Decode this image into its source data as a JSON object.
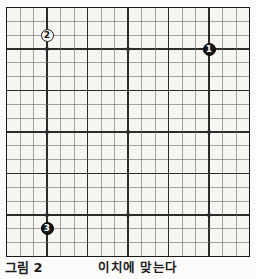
{
  "figure": {
    "caption_label": "그림 2",
    "caption_title": "이치에 맞는다",
    "board_size": 19,
    "board_colors": {
      "paper": "#f7f6f3",
      "line": "#6b6b6b",
      "heavy_line": "#2b2b2b",
      "border": "#1a1a1a",
      "black_stone": "#141414",
      "white_stone": "#fbfbf9",
      "page": "#fdfdfc"
    }
  },
  "board": {
    "star_points": [
      {
        "col": 3,
        "row": 3
      },
      {
        "col": 9,
        "row": 3
      },
      {
        "col": 15,
        "row": 3
      },
      {
        "col": 3,
        "row": 9
      },
      {
        "col": 9,
        "row": 9
      },
      {
        "col": 15,
        "row": 9
      },
      {
        "col": 3,
        "row": 15
      },
      {
        "col": 9,
        "row": 15
      },
      {
        "col": 15,
        "row": 15
      }
    ],
    "stones": [
      {
        "move": "1",
        "color": "black",
        "col": 15,
        "row": 3,
        "label": "1"
      },
      {
        "move": "2",
        "color": "white",
        "col": 3,
        "row": 2,
        "label": "2"
      },
      {
        "move": "3",
        "color": "black",
        "col": 3,
        "row": 16,
        "label": "3"
      }
    ]
  },
  "chart_data": {
    "type": "diagram",
    "title": "그림 2",
    "subtitle": "이치에 맞는다",
    "grid": "19x19",
    "moves": [
      {
        "number": 1,
        "color": "black",
        "coordinate": "Q16",
        "col": 15,
        "row": 3
      },
      {
        "number": 2,
        "color": "white",
        "coordinate": "D17",
        "col": 3,
        "row": 2
      },
      {
        "number": 3,
        "color": "black",
        "coordinate": "D3",
        "col": 3,
        "row": 16
      }
    ]
  }
}
